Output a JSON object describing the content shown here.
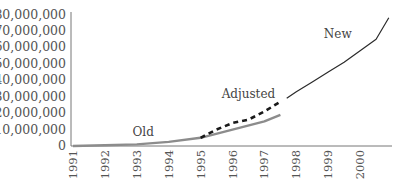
{
  "chart_data": {
    "type": "line",
    "title": "",
    "xlabel": "",
    "ylabel": "",
    "ylim": [
      0,
      80000000
    ],
    "xlim": [
      1991,
      2001
    ],
    "grid": false,
    "legend": "inline annotations",
    "y_ticks": [
      0,
      10000000,
      20000000,
      30000000,
      40000000,
      50000000,
      60000000,
      70000000,
      80000000
    ],
    "y_tick_labels": [
      "0",
      "10,000,000",
      "20,000,000",
      "30,000,000",
      "40,000,000",
      "50,000,000",
      "60,000,000",
      "70,000,000",
      "80,000,000"
    ],
    "x_ticks": [
      1991,
      1992,
      1993,
      1994,
      1995,
      1996,
      1997,
      1998,
      1999,
      2000
    ],
    "x_tick_labels": [
      "1991",
      "1992",
      "1993",
      "1994",
      "1995",
      "1996",
      "1997",
      "1998",
      "1999",
      "2000"
    ],
    "series": [
      {
        "name": "Old",
        "style": "solid",
        "color": "#8c8c8c",
        "x": [
          1991,
          1992,
          1993,
          1994,
          1995,
          1996,
          1997,
          1997.5
        ],
        "values": [
          0,
          500000,
          1000000,
          2500000,
          5000000,
          10000000,
          15000000,
          19000000
        ]
      },
      {
        "name": "Adjusted",
        "style": "dashed",
        "color": "#1a1a1a",
        "x": [
          1995,
          1995.5,
          1996,
          1996.5,
          1997,
          1997.5
        ],
        "values": [
          5000000,
          10000000,
          14000000,
          16000000,
          21000000,
          27000000
        ]
      },
      {
        "name": "New",
        "style": "solid",
        "color": "#2a2a2a",
        "x": [
          1997.7,
          1998,
          1998.5,
          1999,
          1999.5,
          2000,
          2000.5,
          2000.9
        ],
        "values": [
          29000000,
          33000000,
          39000000,
          45000000,
          51000000,
          58000000,
          65000000,
          78000000
        ]
      }
    ],
    "annotations": [
      {
        "text": "Old",
        "x": 1993.2,
        "y": 6000000
      },
      {
        "text": "Adjusted",
        "x": 1996.5,
        "y": 29000000
      },
      {
        "text": "New",
        "x": 1999.3,
        "y": 66000000
      }
    ]
  }
}
